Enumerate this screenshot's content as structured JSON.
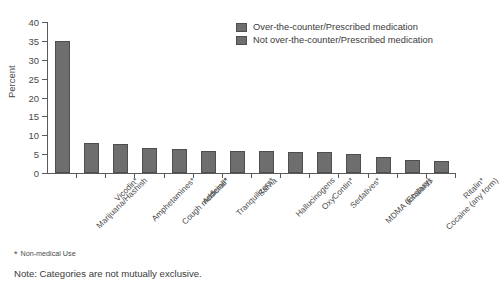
{
  "chart_data": {
    "type": "bar",
    "title": "",
    "xlabel": "",
    "ylabel": "Percent",
    "ylim": [
      0,
      40
    ],
    "yticks": [
      0,
      5,
      10,
      15,
      20,
      25,
      30,
      35,
      40
    ],
    "grid": false,
    "legend_position": "top-right",
    "categories": [
      "Marijuana/Hashish",
      "Vicodin*",
      "Amphetamines*",
      "Cough medicine*",
      "Adderall*",
      "Tranquilizers*",
      "Salvia",
      "Hallucinogens",
      "OxyContin*",
      "Sedatives*",
      "MDMA (Ecstasy)",
      "Inhalants",
      "Cocaine (any form)",
      "Ritalin*"
    ],
    "values": [
      35.0,
      8.0,
      7.8,
      6.5,
      6.3,
      5.9,
      5.8,
      5.8,
      5.6,
      5.5,
      5.1,
      4.2,
      3.5,
      3.2
    ],
    "series": [
      {
        "name": "Percent",
        "values": [
          35.0,
          8.0,
          7.8,
          6.5,
          6.3,
          5.9,
          5.8,
          5.8,
          5.6,
          5.5,
          5.1,
          4.2,
          3.5,
          3.2
        ]
      }
    ],
    "bar_color": "#6e6e6e",
    "bar_edge_color": "#4e4e4e",
    "annotations": [
      "* Non-medical Use",
      "Note: Categories are not mutually exclusive."
    ]
  },
  "legend": {
    "items": [
      {
        "label": "Over-the-counter/Prescribed medication",
        "color": "#6e6e6e"
      },
      {
        "label": "Not over-the-counter/Prescribed medication",
        "color": "#6e6e6e"
      }
    ]
  },
  "footnote": {
    "star": "*",
    "text": "Non-medical Use"
  },
  "note": {
    "text": "Note: Categories are not mutually exclusive."
  }
}
